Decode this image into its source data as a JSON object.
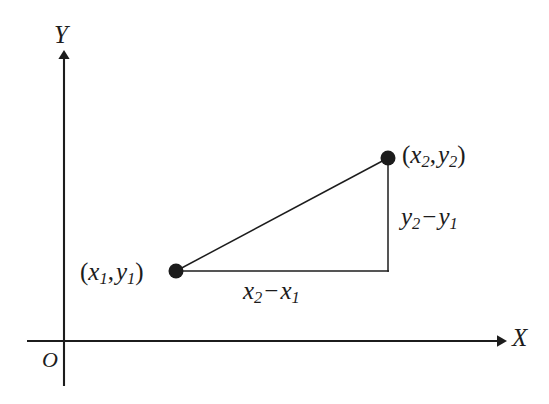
{
  "figure": {
    "background_color": "#ffffff",
    "ink_color": "#1c1c1c",
    "axes": {
      "x_axis_label": "X",
      "y_axis_label": "Y",
      "origin_label": "O",
      "x_axis": {
        "x1": 27,
        "y1": 341,
        "x2": 505,
        "y2": 341,
        "arrow": "right"
      },
      "y_axis": {
        "x1": 64,
        "y1": 52,
        "x2": 64,
        "y2": 386,
        "arrow": "up"
      },
      "x_label_pos": {
        "x": 512,
        "y": 327
      },
      "y_label_pos": {
        "x": 54,
        "y": 22
      },
      "origin_label_pos": {
        "x": 42,
        "y": 348
      }
    },
    "points": [
      {
        "name": "point-1",
        "label_parts": {
          "open": "(",
          "var1": "x",
          "sub1": "1",
          "comma": ",",
          "var2": "y",
          "sub2": "1",
          "close": ")"
        },
        "label_text": "(x1, y1)",
        "dot": {
          "cx": 176,
          "cy": 271,
          "r": 7.5
        },
        "label_pos": {
          "x": 80,
          "y": 258
        }
      },
      {
        "name": "point-2",
        "label_parts": {
          "open": "(",
          "var1": "x",
          "sub1": "2",
          "comma": ",",
          "var2": "y",
          "sub2": "2",
          "close": ")"
        },
        "label_text": "(x2, y2)",
        "dot": {
          "cx": 388,
          "cy": 158,
          "r": 7.5
        },
        "label_pos": {
          "x": 402,
          "y": 141
        }
      }
    ],
    "triangle": {
      "hypotenuse": {
        "x1": 176,
        "y1": 271,
        "x2": 388,
        "y2": 158
      },
      "horizontal_leg": {
        "x1": 176,
        "y1": 271,
        "x2": 388,
        "y2": 271
      },
      "vertical_leg": {
        "x1": 388,
        "y1": 158,
        "x2": 388,
        "y2": 271
      }
    },
    "segment_labels": [
      {
        "name": "delta-x",
        "parts": {
          "var1": "x",
          "sub1": "2",
          "op": "−",
          "var2": "x",
          "sub2": "1"
        },
        "text": "x2 − x1",
        "pos": {
          "x": 243,
          "y": 277
        }
      },
      {
        "name": "delta-y",
        "parts": {
          "var1": "y",
          "sub1": "2",
          "op": "−",
          "var2": "y",
          "sub2": "1"
        },
        "text": "y2 − y1",
        "pos": {
          "x": 401,
          "y": 203
        }
      }
    ]
  }
}
